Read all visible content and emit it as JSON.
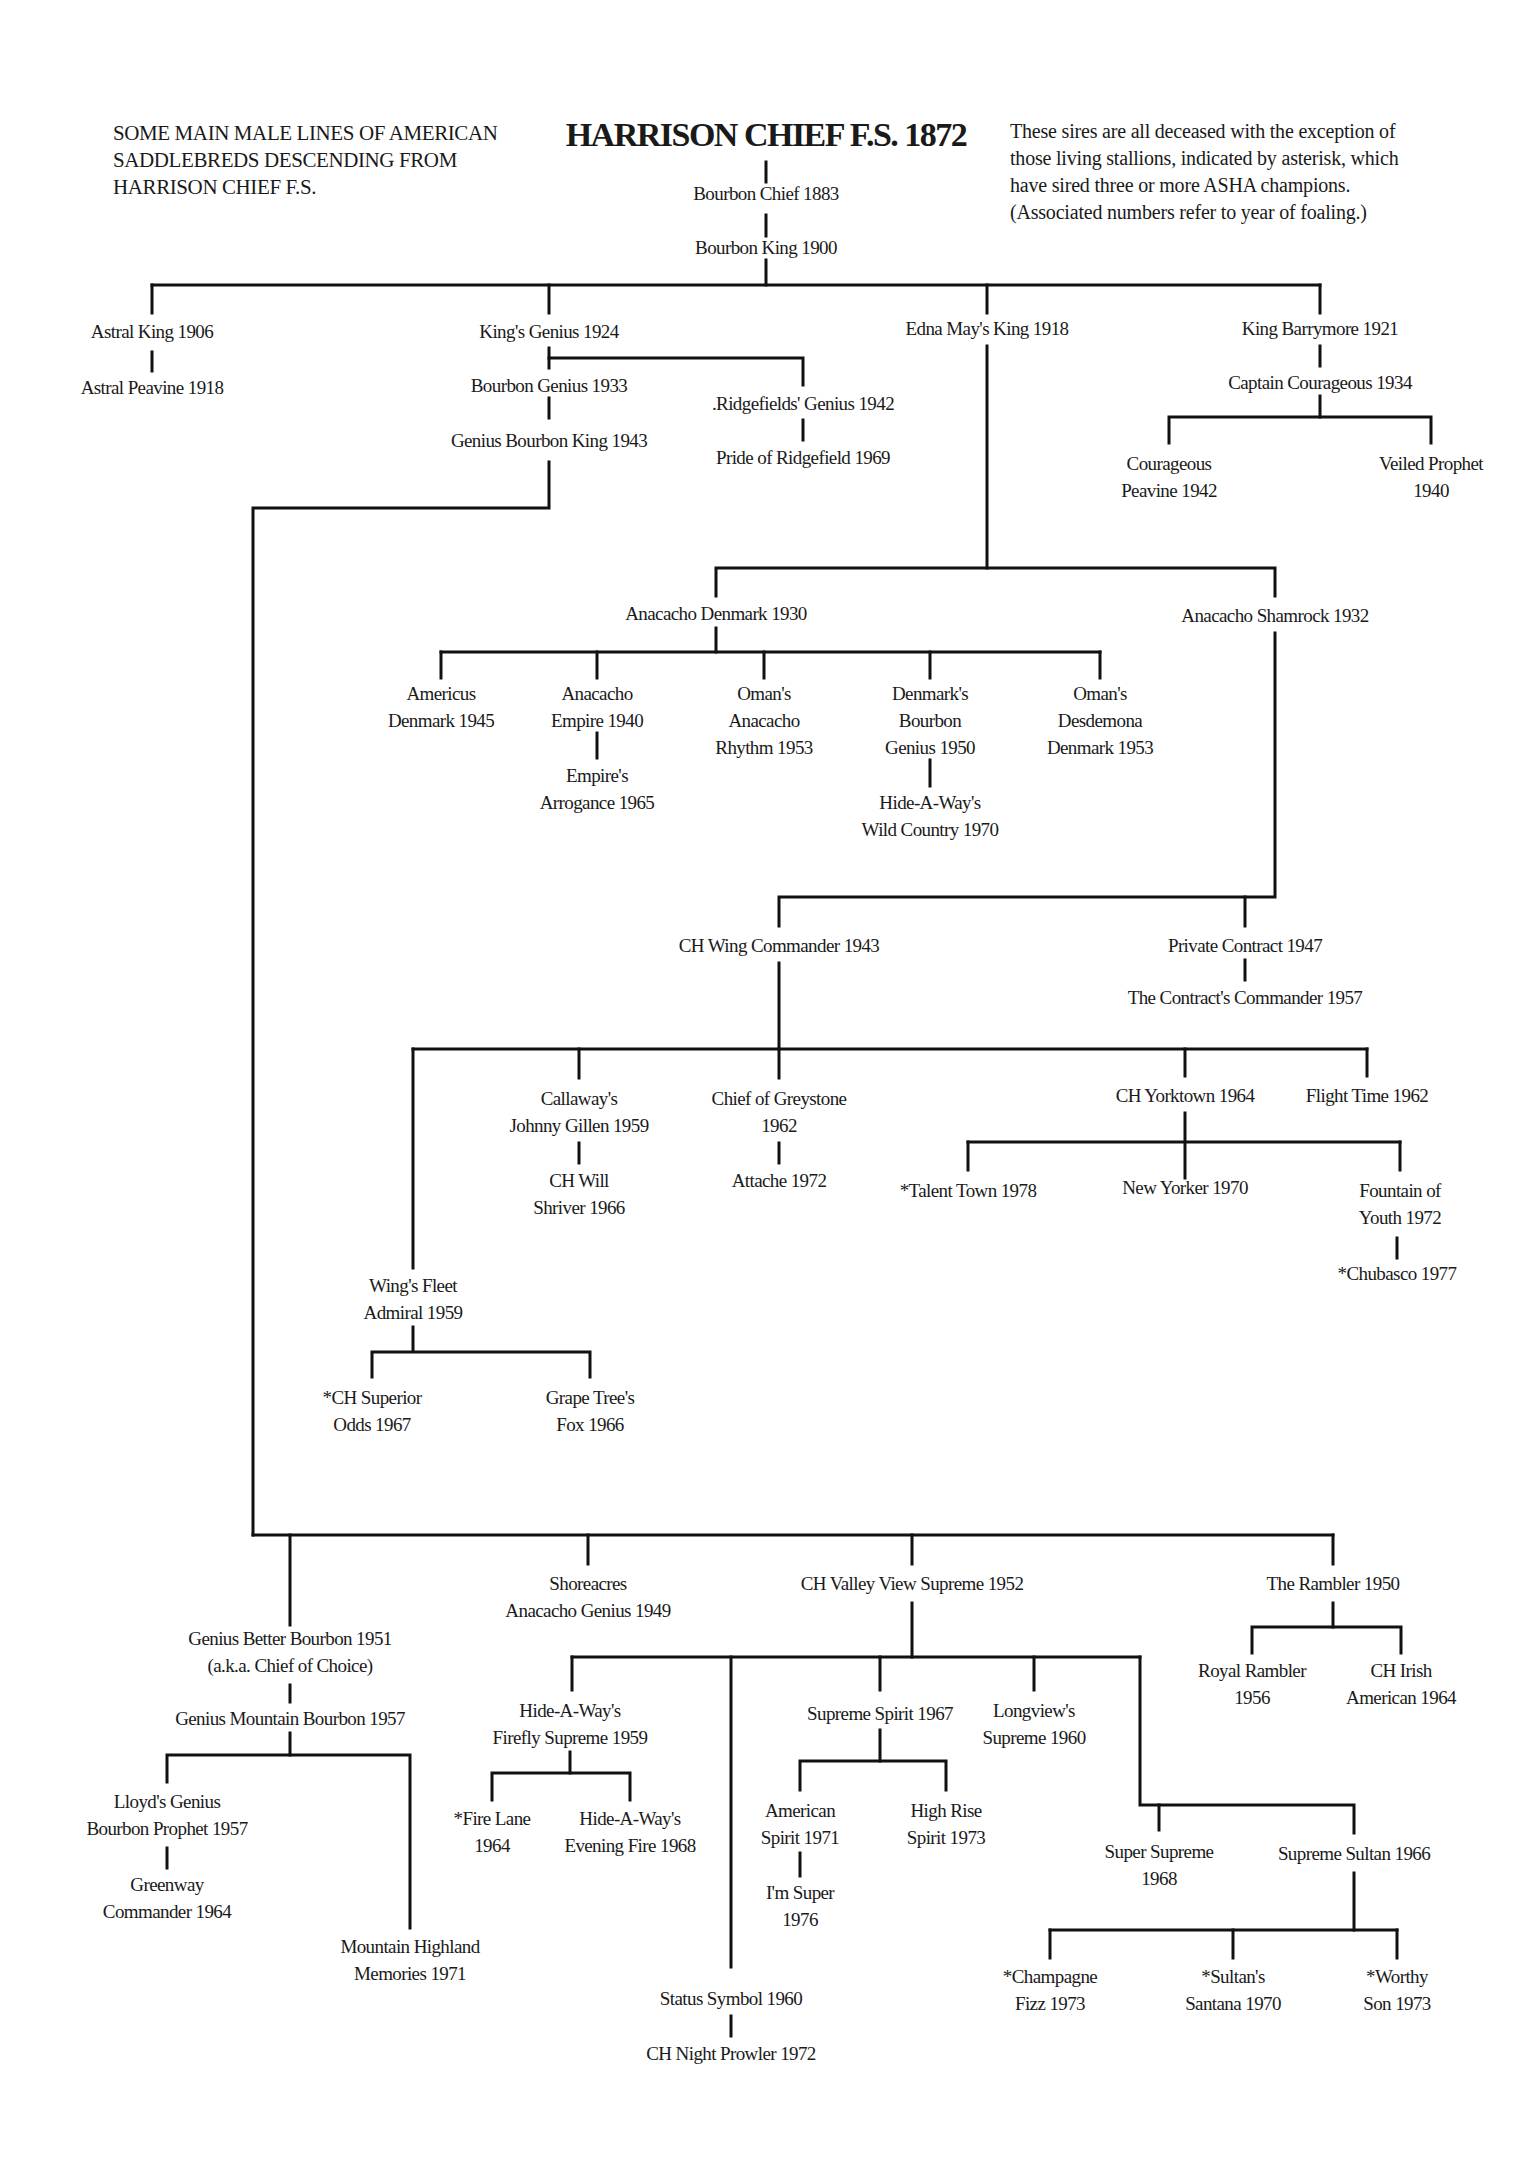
{
  "header": {
    "left_caption": "SOME MAIN MALE LINES OF AMERICAN\nSADDLEBREDS DESCENDING FROM\nHARRISON CHIEF F.S.",
    "title": "HARRISON CHIEF F.S. 1872",
    "note": "These sires are all deceased with the exception of\nthose living stallions, indicated by asterisk, which\nhave sired three or more ASHA champions.\n(Associated numbers refer to year of foaling.)"
  },
  "nodes": {
    "bourbon_chief": "Bourbon Chief 1883",
    "bourbon_king": "Bourbon King 1900",
    "astral_king": "Astral King 1906",
    "astral_peavine": "Astral Peavine 1918",
    "kings_genius": "King's Genius 1924",
    "bourbon_genius": "Bourbon Genius 1933",
    "genius_bourbon_king": "Genius Bourbon King 1943",
    "ridgefields_genius": ".Ridgefields' Genius 1942",
    "pride_of_ridgefield": "Pride of Ridgefield 1969",
    "edna_mays_king": "Edna May's King 1918",
    "king_barrymore": "King Barrymore 1921",
    "captain_courageous": "Captain Courageous 1934",
    "courageous_peavine": "Courageous\nPeavine 1942",
    "veiled_prophet": "Veiled Prophet\n1940",
    "anacacho_denmark": "Anacacho Denmark 1930",
    "anacacho_shamrock": "Anacacho Shamrock 1932",
    "americus_denmark": "Americus\nDenmark 1945",
    "anacacho_empire": "Anacacho\nEmpire 1940",
    "empires_arrogance": "Empire's\nArrogance 1965",
    "omans_anacacho_rhythm": "Oman's\nAnacacho\nRhythm 1953",
    "denmarks_bourbon_genius": "Denmark's\nBourbon\nGenius 1950",
    "hideaways_wild_country": "Hide-A-Way's\nWild Country 1970",
    "omans_desdemona_denmark": "Oman's\nDesdemona\nDenmark 1953",
    "ch_wing_commander": "CH Wing Commander 1943",
    "private_contract": "Private Contract 1947",
    "contracts_commander": "The Contract's Commander 1957",
    "callaways_johnny_gillen": "Callaway's\nJohnny Gillen 1959",
    "ch_will_shriver": "CH Will\nShriver 1966",
    "chief_of_greystone": "Chief of Greystone\n1962",
    "attache": "Attache 1972",
    "ch_yorktown": "CH Yorktown 1964",
    "flight_time": "Flight Time 1962",
    "talent_town": "*Talent Town 1978",
    "new_yorker": "New Yorker 1970",
    "fountain_of_youth": "Fountain of\nYouth 1972",
    "chubasco": "*Chubasco 1977",
    "wings_fleet_admiral": "Wing's Fleet\nAdmiral 1959",
    "ch_superior_odds": "*CH Superior\nOdds 1967",
    "grape_trees_fox": "Grape Tree's\nFox 1966",
    "genius_better_bourbon": "Genius Better Bourbon 1951\n(a.k.a. Chief of Choice)",
    "genius_mountain_bourbon": "Genius Mountain Bourbon 1957",
    "lloyds_genius_bourbon_prophet": "Lloyd's Genius\nBourbon Prophet 1957",
    "greenway_commander": "Greenway\nCommander 1964",
    "mountain_highland_memories": "Mountain Highland\nMemories 1971",
    "shoreacres_anacacho_genius": "Shoreacres\nAnacacho Genius 1949",
    "ch_valley_view_supreme": "CH Valley View Supreme 1952",
    "hideaways_firefly_supreme": "Hide-A-Way's\nFirefly Supreme 1959",
    "fire_lane": "*Fire Lane\n1964",
    "hideaways_evening_fire": "Hide-A-Way's\nEvening Fire 1968",
    "supreme_spirit": "Supreme Spirit 1967",
    "american_spirit": "American\nSpirit 1971",
    "im_super": "I'm Super\n1976",
    "high_rise_spirit": "High Rise\nSpirit 1973",
    "longviews_supreme": "Longview's\nSupreme 1960",
    "super_supreme": "Super Supreme\n1968",
    "supreme_sultan": "Supreme Sultan 1966",
    "champagne_fizz": "*Champagne\nFizz 1973",
    "sultans_santana": "*Sultan's\nSantana 1970",
    "worthy_son": "*Worthy\nSon 1973",
    "status_symbol": "Status Symbol 1960",
    "ch_night_prowler": "CH Night Prowler 1972",
    "the_rambler": "The Rambler 1950",
    "royal_rambler": "Royal Rambler\n1956",
    "ch_irish_american": "CH Irish\nAmerican 1964"
  }
}
